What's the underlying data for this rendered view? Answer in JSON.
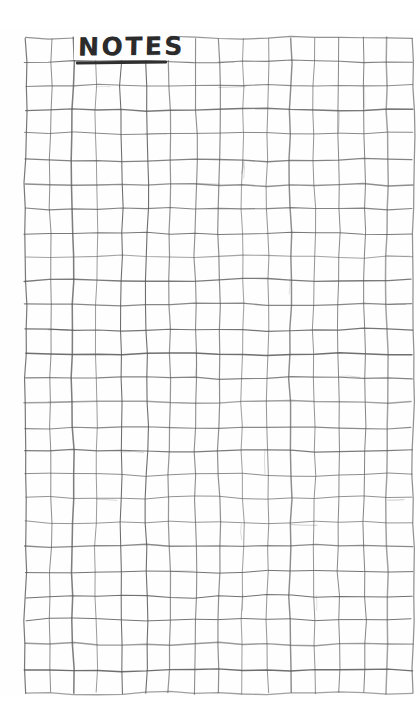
{
  "page": {
    "kind": "hand-drawn-graph-paper-note",
    "title": "NOTES",
    "background_color": "#fefefe",
    "ink_color": "#4a4a4a",
    "title_ink_color": "#2b2b2b",
    "body_text": "",
    "width": 420,
    "height": 727
  },
  "grid": {
    "left": 25,
    "top": 38,
    "right": 412,
    "bottom": 693,
    "columns": 16,
    "rows": 27,
    "cell_width": 24.2,
    "cell_height": 24.3,
    "line_color": "#5a5a5a",
    "line_width": 1.1,
    "style": "hand-drawn"
  },
  "title_block": {
    "label": "NOTES",
    "left": 78,
    "top": 33,
    "underline": true,
    "underline_width": 91
  }
}
